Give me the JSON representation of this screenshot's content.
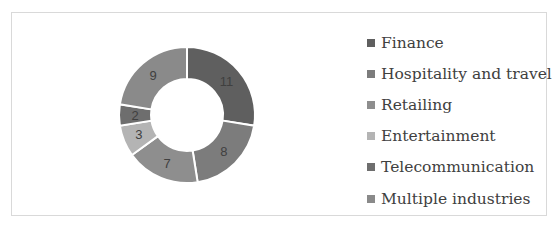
{
  "chart_data": {
    "type": "pie",
    "subtype": "donut",
    "title": "",
    "categories": [
      "Finance",
      "Hospitality and travel",
      "Retailing",
      "Entertainment",
      "Telecommunication",
      "Multiple industries"
    ],
    "values": [
      11,
      8,
      7,
      3,
      2,
      9
    ],
    "colors": [
      "#5f5f5f",
      "#7c7c7c",
      "#8e8e8e",
      "#b4b4b4",
      "#6e6e6e",
      "#8a8a8a"
    ],
    "data_labels": [
      "11",
      "8",
      "7",
      "3",
      "2",
      "9"
    ],
    "start_angle_deg": 0,
    "direction": "clockwise",
    "legend_position": "right",
    "grid": false
  },
  "legend": {
    "items": [
      {
        "label": "Finance",
        "color": "#5f5f5f"
      },
      {
        "label": "Hospitality and travel",
        "color": "#7c7c7c"
      },
      {
        "label": "Retailing",
        "color": "#8e8e8e"
      },
      {
        "label": "Entertainment",
        "color": "#b4b4b4"
      },
      {
        "label": "Telecommunication",
        "color": "#6e6e6e"
      },
      {
        "label": "Multiple industries",
        "color": "#8a8a8a"
      }
    ]
  }
}
